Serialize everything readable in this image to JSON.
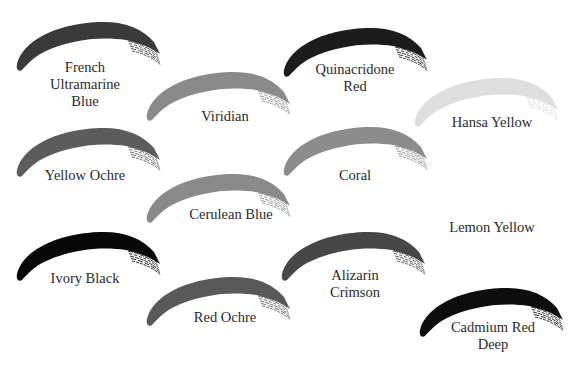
{
  "swatches": [
    {
      "name": "French\nUltramarine\nBlue",
      "color": "#3a3a3a",
      "x": 14,
      "y": 14,
      "lx": 5,
      "ly": 59
    },
    {
      "name": "Viridian",
      "color": "#8a8a8a",
      "x": 144,
      "y": 64,
      "lx": 145,
      "ly": 108
    },
    {
      "name": "Quinacridone\nRed",
      "color": "#1c1c1c",
      "x": 281,
      "y": 20,
      "lx": 275,
      "ly": 61
    },
    {
      "name": "Hansa Yellow",
      "color": "#dedede",
      "x": 412,
      "y": 70,
      "lx": 412,
      "ly": 114
    },
    {
      "name": "Yellow Ochre",
      "color": "#5c5c5c",
      "x": 14,
      "y": 120,
      "lx": 5,
      "ly": 167
    },
    {
      "name": "Coral",
      "color": "#8c8c8c",
      "x": 281,
      "y": 119,
      "lx": 275,
      "ly": 167
    },
    {
      "name": "Cerulean Blue",
      "color": "#8a8a8a",
      "x": 144,
      "y": 166,
      "lx": 151,
      "ly": 206
    },
    {
      "name": "Lemon Yellow",
      "color": "#ffffff",
      "x": 412,
      "y": 180,
      "lx": 412,
      "ly": 219
    },
    {
      "name": "Ivory Black",
      "color": "#080808",
      "x": 14,
      "y": 224,
      "lx": 5,
      "ly": 270
    },
    {
      "name": "Alizarin\nCrimson",
      "color": "#474747",
      "x": 279,
      "y": 224,
      "lx": 275,
      "ly": 267
    },
    {
      "name": "Red Ochre",
      "color": "#595959",
      "x": 144,
      "y": 269,
      "lx": 145,
      "ly": 309
    },
    {
      "name": "Cadmium Red\nDeep",
      "color": "#0d0d0d",
      "x": 417,
      "y": 280,
      "lx": 413,
      "ly": 319
    }
  ]
}
